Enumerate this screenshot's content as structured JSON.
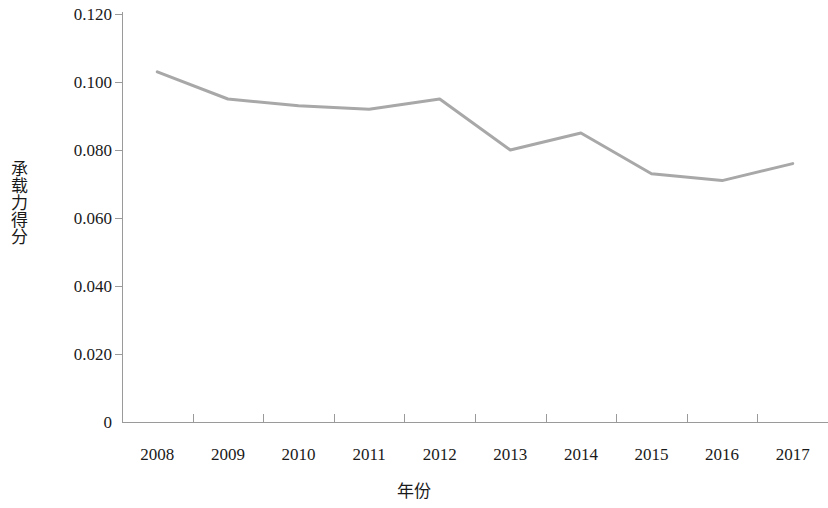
{
  "chart_data": {
    "type": "line",
    "title": "",
    "subtitle": "",
    "xlabel": "年份",
    "ylabel": "承载力得分",
    "categories": [
      "2008",
      "2009",
      "2010",
      "2011",
      "2012",
      "2013",
      "2014",
      "2015",
      "2016",
      "2017"
    ],
    "series": [
      {
        "name": "承载力得分",
        "color": "#a8a8a8",
        "values": [
          0.103,
          0.095,
          0.093,
          0.092,
          0.095,
          0.08,
          0.085,
          0.073,
          0.071,
          0.076
        ]
      }
    ],
    "ylim": [
      0,
      0.12
    ],
    "y_ticks": [
      0,
      0.02,
      0.04,
      0.06,
      0.08,
      0.1,
      0.12
    ],
    "y_tick_labels": [
      "0",
      "0.020",
      "0.040",
      "0.060",
      "0.080",
      "0.100",
      "0.120"
    ],
    "grid": false,
    "legend": false,
    "legend_position": "none",
    "line_width": 3,
    "markers": false,
    "background_color": "#ffffff",
    "axis_color": "#9a9a9a",
    "text_color": "#1a1a1a"
  }
}
